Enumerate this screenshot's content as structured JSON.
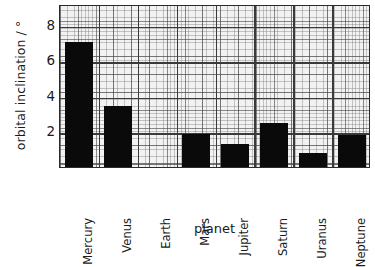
{
  "chart_data": {
    "type": "bar",
    "title": "",
    "xlabel": "planet",
    "ylabel": "orbital inclination / °",
    "categories": [
      "Mercury",
      "Venus",
      "Earth",
      "Mars",
      "Jupiter",
      "Saturn",
      "Uranus",
      "Neptune"
    ],
    "values": [
      7.0,
      3.4,
      0.0,
      1.85,
      1.3,
      2.5,
      0.8,
      1.8
    ],
    "ylim": [
      0,
      9.2
    ],
    "yticks": [
      2,
      4,
      6,
      8
    ],
    "ytick_labels": [
      "2",
      "4",
      "6",
      "8"
    ],
    "grid": true,
    "grid_style": "graph-paper",
    "legend": "none",
    "bar_color": "#0a0a0a",
    "plot_background": "#f2f2f2",
    "axis_color": "#2b2b2b"
  },
  "axes": {
    "y_title": "orbital inclination / °",
    "x_title": "planet",
    "y_ticks": [
      {
        "label": "8",
        "value": 8
      },
      {
        "label": "6",
        "value": 6
      },
      {
        "label": "4",
        "value": 4
      },
      {
        "label": "2",
        "value": 2
      }
    ],
    "x_ticks": [
      {
        "label": "Mercury"
      },
      {
        "label": "Venus"
      },
      {
        "label": "Earth"
      },
      {
        "label": "Mars"
      },
      {
        "label": "Jupiter"
      },
      {
        "label": "Saturn"
      },
      {
        "label": "Uranus"
      },
      {
        "label": "Neptune"
      }
    ]
  }
}
